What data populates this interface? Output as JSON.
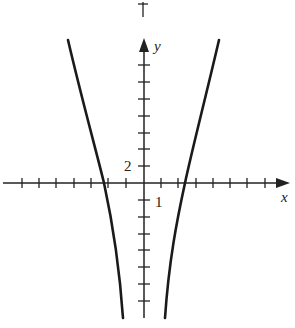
{
  "figure": {
    "type": "graph",
    "axes": {
      "x_label": "x",
      "y_label": "y",
      "x_scale_label": "1",
      "y_scale_label": "2",
      "x_tick_spacing": 1,
      "y_tick_spacing": 2
    },
    "curves": [
      {
        "name": "left-branch",
        "description": "steep curve crossing x-axis near x=-2, descending to the right"
      },
      {
        "name": "right-branch",
        "description": "steep curve crossing x-axis near x=2, descending to the left"
      }
    ],
    "colors": {
      "stroke": "#1a1a1a",
      "background": "#ffffff"
    }
  }
}
